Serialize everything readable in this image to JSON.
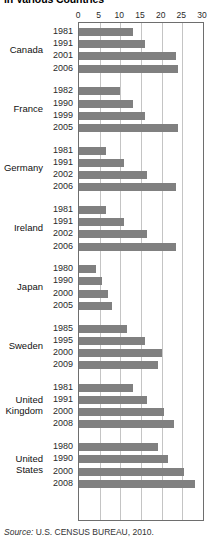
{
  "title": "in Various Countries",
  "source": {
    "prefix": "Source:",
    "text": " U.S. CENSUS BUREAU, 2010."
  },
  "colors": {
    "bar": "#808080",
    "gridline": "#c4c4c4",
    "axis": "#6e6e6e",
    "background": "#ffffff",
    "text": "#1a1a1a"
  },
  "axis": {
    "ticks": [
      "0",
      "5",
      "10",
      "15",
      "20",
      "25",
      "30"
    ],
    "min": 0,
    "max": 30,
    "step": 5
  },
  "chart_data": {
    "type": "bar",
    "orientation": "horizontal",
    "title": "in Various Countries",
    "xlabel": "",
    "ylabel": "",
    "xlim": [
      0,
      30
    ],
    "xticks": [
      0,
      5,
      10,
      15,
      20,
      25,
      30
    ],
    "grid": true,
    "legend": "none",
    "annotation": "Source: U.S. CENSUS BUREAU, 2010.",
    "groups": [
      {
        "country": "Canada",
        "country_lines": [
          "Canada"
        ],
        "categories": [
          "1981",
          "1991",
          "2001",
          "2006"
        ],
        "values": [
          13.0,
          16.0,
          23.5,
          24.0
        ]
      },
      {
        "country": "France",
        "country_lines": [
          "France"
        ],
        "categories": [
          "1982",
          "1990",
          "1999",
          "2005"
        ],
        "values": [
          10.0,
          13.0,
          16.0,
          24.0
        ]
      },
      {
        "country": "Germany",
        "country_lines": [
          "Germany"
        ],
        "categories": [
          "1981",
          "1991",
          "2002",
          "2006"
        ],
        "values": [
          6.5,
          11.0,
          16.5,
          23.5
        ]
      },
      {
        "country": "Ireland",
        "country_lines": [
          "Ireland"
        ],
        "categories": [
          "1981",
          "1991",
          "2002",
          "2006"
        ],
        "values": [
          6.5,
          11.0,
          16.5,
          23.5
        ]
      },
      {
        "country": "Japan",
        "country_lines": [
          "Japan"
        ],
        "categories": [
          "1980",
          "1990",
          "2000",
          "2005"
        ],
        "values": [
          4.2,
          5.5,
          7.0,
          8.0
        ]
      },
      {
        "country": "Sweden",
        "country_lines": [
          "Sweden"
        ],
        "categories": [
          "1985",
          "1995",
          "2000",
          "2009"
        ],
        "values": [
          11.5,
          16.0,
          20.0,
          19.0
        ]
      },
      {
        "country": "United Kingdom",
        "country_lines": [
          "United",
          "Kingdom"
        ],
        "categories": [
          "1981",
          "1991",
          "2000",
          "2008"
        ],
        "values": [
          13.0,
          16.5,
          20.5,
          23.0
        ]
      },
      {
        "country": "United States",
        "country_lines": [
          "United",
          "States"
        ],
        "categories": [
          "1980",
          "1990",
          "2000",
          "2008"
        ],
        "values": [
          19.0,
          21.5,
          25.5,
          28.0
        ]
      }
    ]
  }
}
